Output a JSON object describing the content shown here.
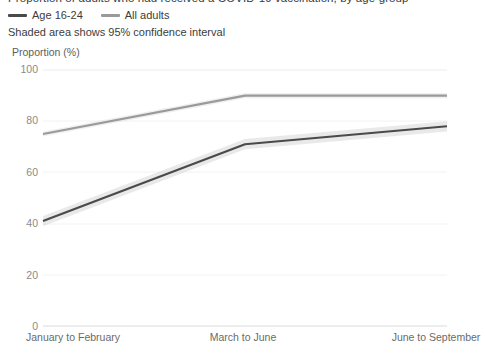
{
  "header": {
    "clipped_title": "Proportion of adults who had received a COVID-19 vaccination, by age group"
  },
  "legend": {
    "position": "top-left",
    "items": [
      {
        "label": "Age 16-24",
        "color": "#4a4a4a"
      },
      {
        "label": "All adults",
        "color": "#9a9a9a"
      }
    ]
  },
  "note": "Shaded area shows 95% confidence interval",
  "chart_data": {
    "type": "line",
    "title": "",
    "subtitle": "Shaded area shows 95% confidence interval",
    "xlabel": "",
    "ylabel": "Proportion (%)",
    "ylim": [
      0,
      100
    ],
    "yticks": [
      0,
      20,
      40,
      60,
      80,
      100
    ],
    "ytick_labels": [
      "0",
      "20",
      "40",
      "60",
      "80",
      "100"
    ],
    "categories": [
      "January to February",
      "March to June",
      "June to September"
    ],
    "grid": true,
    "legend_position": "top-left",
    "series": [
      {
        "name": "Age 16-24",
        "color": "#4a4a4a",
        "values": [
          41,
          71,
          78
        ],
        "ci_lower": [
          39,
          69,
          76
        ],
        "ci_upper": [
          43,
          73,
          80
        ]
      },
      {
        "name": "All adults",
        "color": "#9a9a9a",
        "values": [
          75,
          90,
          90
        ],
        "ci_lower": [
          74,
          89,
          89
        ],
        "ci_upper": [
          76,
          91,
          91
        ]
      }
    ]
  },
  "axis": {
    "y_title": "Proportion (%)"
  }
}
